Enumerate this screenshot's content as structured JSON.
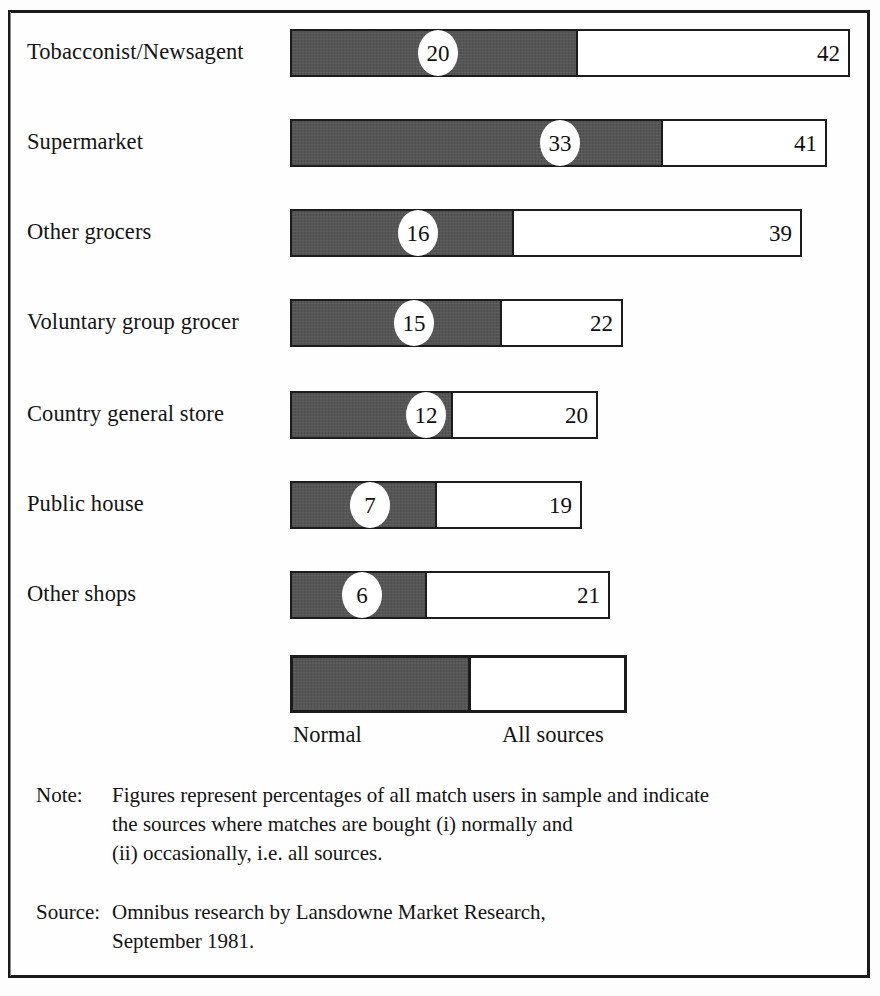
{
  "chart_data": {
    "type": "bar",
    "orientation": "horizontal",
    "stacked": true,
    "title": "",
    "xlabel": "",
    "ylabel": "",
    "categories": [
      "Tobacconist/Newsagent",
      "Supermarket",
      "Other grocers",
      "Voluntary group grocer",
      "Country general store",
      "Public house",
      "Other shops"
    ],
    "series": [
      {
        "name": "Normal",
        "values": [
          20,
          33,
          16,
          15,
          12,
          7,
          6
        ]
      },
      {
        "name": "All sources",
        "values": [
          42,
          41,
          39,
          22,
          20,
          19,
          21
        ]
      }
    ],
    "xlim": [
      0,
      42
    ],
    "grid": false,
    "legend_position": "bottom",
    "colors": {
      "normal": "#555555",
      "all_sources": "#ffffff",
      "outline": "#1c1c1c"
    }
  },
  "rows": [
    {
      "label": "Tobacconist/Newsagent",
      "normal": "20",
      "total": "42",
      "dark_px": 288,
      "total_px": 560,
      "badge_px": 148,
      "total_label_px": 527
    },
    {
      "label": "Supermarket",
      "normal": "33",
      "total": "41",
      "dark_px": 373,
      "total_px": 537,
      "badge_px": 270,
      "total_label_px": 504
    },
    {
      "label": "Other grocers",
      "normal": "16",
      "total": "39",
      "dark_px": 224,
      "total_px": 512,
      "badge_px": 128,
      "total_label_px": 479
    },
    {
      "label": "Voluntary group grocer",
      "normal": "15",
      "total": "22",
      "dark_px": 212,
      "total_px": 333,
      "badge_px": 124,
      "total_label_px": 300
    },
    {
      "label": "Country general store",
      "normal": "12",
      "total": "20",
      "dark_px": 163,
      "total_px": 308,
      "badge_px": 136,
      "total_label_px": 275
    },
    {
      "label": "Public house",
      "normal": "7",
      "total": "19",
      "dark_px": 147,
      "total_px": 292,
      "badge_px": 80,
      "total_label_px": 259
    },
    {
      "label": "Other shops",
      "normal": "6",
      "total": "21",
      "dark_px": 137,
      "total_px": 320,
      "badge_px": 72,
      "total_label_px": 287
    }
  ],
  "legend": {
    "normal_label": "Normal",
    "all_sources_label": "All sources"
  },
  "footnotes": {
    "note_key": "Note:",
    "note_lines": [
      "Figures represent percentages of all match users in sample and indicate",
      "the sources where matches are bought (i) normally and",
      "(ii) occasionally, i.e. all sources."
    ],
    "source_key": "Source:",
    "source_lines": [
      "Omnibus research by Lansdowne Market Research,",
      "September 1981."
    ]
  }
}
